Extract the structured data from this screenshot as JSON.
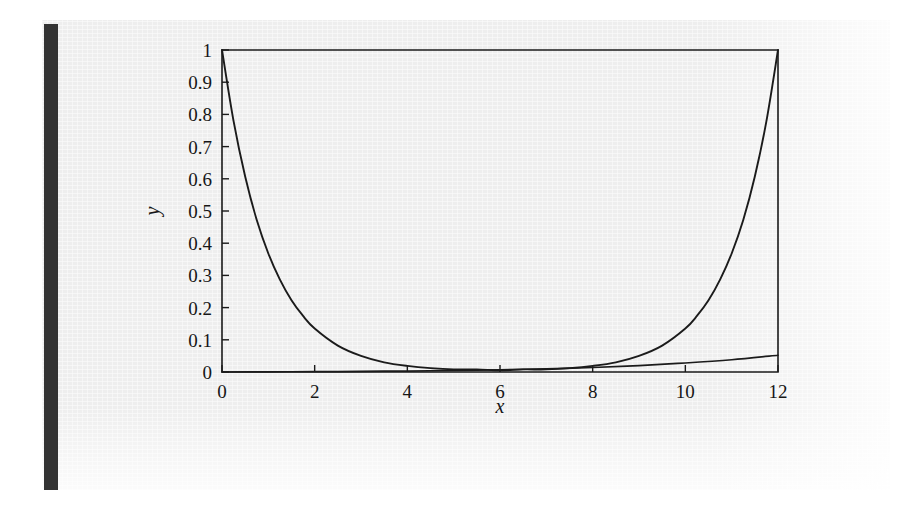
{
  "figure": {
    "page_background": "#eeeeee",
    "outer_background": "#ffffff",
    "spine_color": "#333333",
    "ink_color": "#1b1b1b"
  },
  "chart_data": {
    "type": "line",
    "title": "",
    "subtitle": "",
    "xlabel": "x",
    "ylabel": "y",
    "xlim": [
      0,
      12
    ],
    "ylim": [
      0,
      1
    ],
    "grid": false,
    "legend": false,
    "legend_position": "none",
    "xticks": [
      0,
      2,
      4,
      6,
      8,
      10,
      12
    ],
    "xtick_labels": [
      "0",
      "2",
      "4",
      "6",
      "8",
      "10",
      "12"
    ],
    "yticks": [
      0,
      0.1,
      0.2,
      0.3,
      0.4,
      0.5,
      0.6,
      0.7,
      0.8,
      0.9,
      1
    ],
    "ytick_labels": [
      "0",
      "0.1",
      "0.2",
      "0.3",
      "0.4",
      "0.5",
      "0.6",
      "0.7",
      "0.8",
      "0.9",
      "1"
    ],
    "annotations": [],
    "series": [
      {
        "name": "symmetric-exponential-well",
        "description": "U-shaped curve, value 1 at both x=0 and x=12, near 0 in the middle",
        "x": [
          0,
          0.25,
          0.5,
          0.75,
          1,
          1.25,
          1.5,
          1.75,
          2,
          2.5,
          3,
          3.5,
          4,
          4.5,
          5,
          5.5,
          6,
          6.5,
          7,
          7.5,
          8,
          8.5,
          9,
          9.5,
          10,
          10.25,
          10.5,
          10.75,
          11,
          11.25,
          11.5,
          11.75,
          12
        ],
        "values": [
          1.0,
          0.779,
          0.607,
          0.472,
          0.368,
          0.287,
          0.223,
          0.174,
          0.135,
          0.082,
          0.05,
          0.03,
          0.019,
          0.012,
          0.008,
          0.008,
          0.005,
          0.008,
          0.008,
          0.012,
          0.019,
          0.03,
          0.05,
          0.082,
          0.135,
          0.174,
          0.223,
          0.287,
          0.368,
          0.472,
          0.607,
          0.779,
          1.0
        ]
      },
      {
        "name": "shallow-rising-curve",
        "description": "Nearly flat curve rising slowly to about 0.05 at x=12",
        "x": [
          0,
          1,
          2,
          3,
          4,
          5,
          6,
          7,
          8,
          9,
          10,
          11,
          12
        ],
        "values": [
          0.0,
          0.0005,
          0.001,
          0.002,
          0.003,
          0.005,
          0.007,
          0.01,
          0.014,
          0.02,
          0.028,
          0.038,
          0.052
        ]
      }
    ]
  }
}
